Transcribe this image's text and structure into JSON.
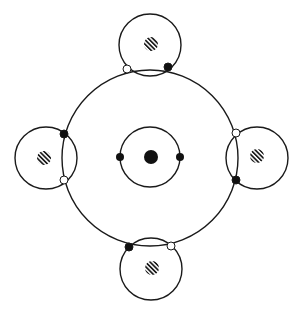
{
  "diagram": {
    "description": "Atomic bonding diagram: central atom with two electrons in an inner shell, outer shell shared with four surrounding atoms (covalent bonds), each bond shown with one dark and one light electron",
    "colors": {
      "stroke": "#1a1a1a",
      "dark_electron": "#111111",
      "light_electron": "#ffffff",
      "background": "#ffffff"
    },
    "central_atom": {
      "nucleus": {
        "cx": 151,
        "cy": 157,
        "r": 7
      },
      "inner_shell": {
        "cx": 150,
        "cy": 157,
        "r": 30
      },
      "inner_electrons": [
        {
          "cx": 120,
          "cy": 157,
          "r": 4,
          "type": "dark"
        },
        {
          "cx": 180,
          "cy": 157,
          "r": 4,
          "type": "dark"
        }
      ],
      "outer_shell": {
        "cx": 150,
        "cy": 158,
        "r": 88
      }
    },
    "neighbor_atoms": [
      {
        "name": "top",
        "shell": {
          "cx": 150,
          "cy": 45,
          "r": 31
        },
        "nucleus": {
          "cx": 151,
          "cy": 44,
          "r": 7
        },
        "electrons": [
          {
            "cx": 127,
            "cy": 69,
            "r": 4,
            "type": "light"
          },
          {
            "cx": 168,
            "cy": 67,
            "r": 4,
            "type": "dark"
          }
        ]
      },
      {
        "name": "left",
        "shell": {
          "cx": 46,
          "cy": 158,
          "r": 31
        },
        "nucleus": {
          "cx": 44,
          "cy": 158,
          "r": 7
        },
        "electrons": [
          {
            "cx": 64,
            "cy": 134,
            "r": 4,
            "type": "dark"
          },
          {
            "cx": 64,
            "cy": 180,
            "r": 4,
            "type": "light"
          }
        ]
      },
      {
        "name": "right",
        "shell": {
          "cx": 257,
          "cy": 158,
          "r": 31
        },
        "nucleus": {
          "cx": 257,
          "cy": 156,
          "r": 7
        },
        "electrons": [
          {
            "cx": 236,
            "cy": 133,
            "r": 4,
            "type": "light"
          },
          {
            "cx": 236,
            "cy": 180,
            "r": 4,
            "type": "dark"
          }
        ]
      },
      {
        "name": "bottom",
        "shell": {
          "cx": 151,
          "cy": 269,
          "r": 31
        },
        "nucleus": {
          "cx": 152,
          "cy": 268,
          "r": 7
        },
        "electrons": [
          {
            "cx": 129,
            "cy": 247,
            "r": 4,
            "type": "dark"
          },
          {
            "cx": 171,
            "cy": 246,
            "r": 4,
            "type": "light"
          }
        ]
      }
    ]
  }
}
